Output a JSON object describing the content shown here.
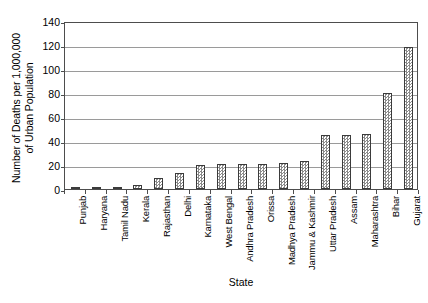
{
  "chart_data": {
    "type": "bar",
    "title": "",
    "xlabel": "State",
    "ylabel": "Number of Deaths per 1,000,000\nof Urban Population",
    "ylim": [
      0,
      140
    ],
    "ytick_step": 20,
    "yticks": [
      140,
      120,
      100,
      80,
      60,
      40,
      20,
      0
    ],
    "grid": true,
    "legend": false,
    "categories": [
      "Punjab",
      "Haryana",
      "Tamil Nadu",
      "Kerala",
      "Rajasthan",
      "Delhi",
      "Karnataka",
      "West Bengal",
      "Andhra Pradesh",
      "Orissa",
      "Madhya Pradesh",
      "Jammu & Kashmir",
      "Uttar Pradesh",
      "Assam",
      "Maharashtra",
      "Bihar",
      "Gujarat"
    ],
    "values": [
      0.3,
      0.8,
      1.2,
      3,
      9,
      13,
      20,
      20.5,
      20.5,
      20.5,
      22,
      23,
      45,
      45,
      45.5,
      80,
      118
    ],
    "bar_fill_color": "#c9c9c9",
    "bar_edge_color": "#3b3b3b",
    "grid_color": "#9a9a9a",
    "axis_color": "#4d4d4d",
    "background_color": "#ffffff"
  }
}
